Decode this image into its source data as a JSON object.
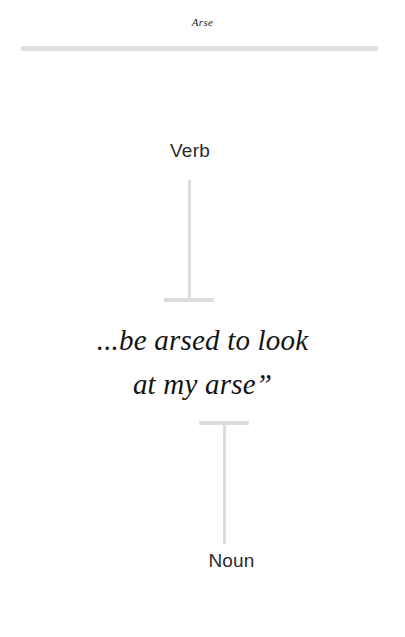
{
  "page": {
    "running_head": "Arse",
    "background_color": "#ffffff",
    "text_color": "#151515",
    "rule_color": "#e0e0e0",
    "connector_color": "#dcdcdc"
  },
  "entry": {
    "upper_pos_label": "Verb",
    "lower_pos_label": "Noun",
    "definition_lines": [
      "...be arsed to look",
      "at my arse”"
    ]
  }
}
